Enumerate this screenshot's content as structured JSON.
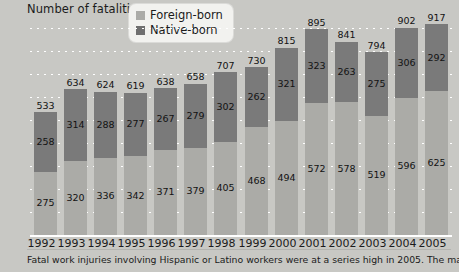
{
  "chart_data": {
    "type": "bar",
    "subtype": "stacked-bar",
    "title": "Number of fatalities",
    "xlabel": "",
    "ylabel": "Number of fatalities",
    "ylim": [
      0,
      900
    ],
    "ytick_step": 100,
    "yticks": [
      "900",
      "800",
      "700",
      "600",
      "500",
      "400",
      "300",
      "200",
      "100",
      "0"
    ],
    "grid": true,
    "grid_style": "dotted-white-horizontal",
    "legend_position": "top-center",
    "categories": [
      "1992",
      "1993",
      "1994",
      "1995",
      "1996",
      "1997",
      "1998",
      "1999",
      "2000",
      "2001",
      "2002",
      "2003",
      "2004",
      "2005"
    ],
    "series": [
      {
        "name": "Foreign-born",
        "color": "#ababa7",
        "values": [
          275,
          320,
          336,
          342,
          371,
          379,
          405,
          468,
          494,
          572,
          578,
          519,
          596,
          625
        ]
      },
      {
        "name": "Native-born",
        "color": "#7a7a7a",
        "values": [
          258,
          314,
          288,
          277,
          267,
          279,
          302,
          262,
          321,
          323,
          263,
          275,
          306,
          292
        ]
      }
    ],
    "totals": [
      533,
      634,
      624,
      619,
      638,
      658,
      707,
      730,
      815,
      895,
      841,
      794,
      902,
      917
    ],
    "annotations": {
      "total_labels_shown": true,
      "segment_labels_shown": true
    }
  },
  "legend": {
    "items": [
      {
        "label": "Foreign-born",
        "color": "#ababa7"
      },
      {
        "label": "Native-born",
        "color": "#6f6f6f"
      }
    ]
  },
  "footnote": {
    "text": "Fatal work injuries involving Hispanic or Latino workers were at a series high in 2005. The majority of"
  },
  "colors": {
    "background": "#c8c8c4",
    "foreign_born": "#ababa7",
    "native_born": "#7a7a7a",
    "gridline": "#ffffff",
    "text": "#1b1b1b"
  }
}
